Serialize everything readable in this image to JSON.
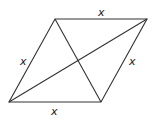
{
  "diagram": {
    "type": "rhombus-with-diagonals",
    "vertices": {
      "top_left": [
        55,
        19
      ],
      "top_right": [
        147,
        19
      ],
      "bottom_right": [
        101,
        102
      ],
      "bottom_left": [
        9,
        102
      ]
    },
    "side_labels": {
      "top": "x",
      "left": "x",
      "right": "x",
      "bottom": "x"
    },
    "stroke_color": "#333333"
  }
}
